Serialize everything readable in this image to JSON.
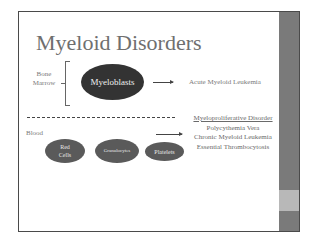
{
  "slide": {
    "title": "Myeloid Disorders",
    "bone_marrow_label_line1": "Bone",
    "bone_marrow_label_line2": "Marrow",
    "myeloblasts": "Myeloblasts",
    "acute_outcome": "Acute Myeloid Leukemia",
    "blood_label": "Blood",
    "blood_cells": [
      {
        "line1": "Red",
        "line2": "Cells"
      },
      {
        "line1": "Granulocytes"
      },
      {
        "line1": "Platelets"
      }
    ],
    "mpd": {
      "heading": "Myeloproliferative Disorder",
      "items": [
        "Polycythemia Vera",
        "Chronic Myeloid Leukemia",
        "Essential Thrombocytosis"
      ]
    }
  },
  "colors": {
    "dark_ellipse": "#333333",
    "cell_ellipse": "#5a5a5a",
    "sidebar": "#7a7a7a",
    "sidebar_accent": "#b8b8b8",
    "title": "#6f6f6f"
  }
}
